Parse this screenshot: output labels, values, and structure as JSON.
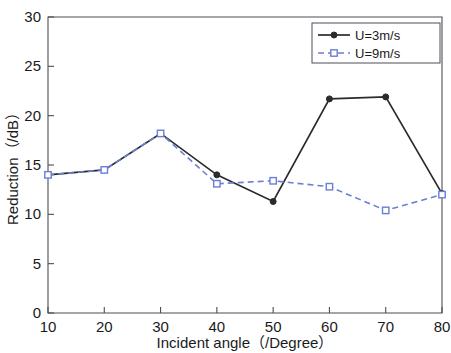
{
  "chart_data": {
    "type": "line",
    "title": "",
    "xlabel": "Incident angle（/Degree）",
    "ylabel": "Reduction（/dB）",
    "xlim": [
      10,
      80
    ],
    "ylim": [
      0,
      30
    ],
    "xticks": [
      10,
      20,
      30,
      40,
      50,
      60,
      70,
      80
    ],
    "yticks": [
      0,
      5,
      10,
      15,
      20,
      25,
      30
    ],
    "xtick_labels": [
      "10",
      "20",
      "30",
      "40",
      "50",
      "60",
      "70",
      "80"
    ],
    "ytick_labels": [
      "0",
      "5",
      "10",
      "15",
      "20",
      "25",
      "30"
    ],
    "grid": false,
    "legend_position": "top-right",
    "x": [
      10,
      20,
      30,
      40,
      50,
      60,
      70,
      80
    ],
    "series": [
      {
        "name": "U=3m/s",
        "color": "#2b2b2b",
        "linestyle": "solid",
        "marker": "circle-filled",
        "values": [
          14.0,
          14.5,
          18.2,
          14.0,
          11.3,
          21.7,
          21.9,
          12.1
        ]
      },
      {
        "name": "U=9m/s",
        "color": "#6a7fd4",
        "linestyle": "dashed",
        "marker": "square-open",
        "values": [
          14.0,
          14.5,
          18.2,
          13.1,
          13.4,
          12.8,
          10.4,
          12.0
        ]
      }
    ]
  },
  "legend": {
    "entries": [
      {
        "label": "U=3m/s"
      },
      {
        "label": "U=9m/s"
      }
    ]
  },
  "axes": {
    "x_title": "Incident angle（/Degree）",
    "y_title": "Reduction（/dB）"
  }
}
